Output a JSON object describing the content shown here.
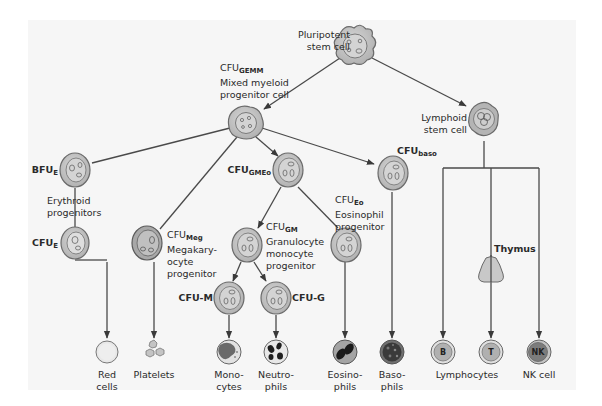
{
  "figure": {
    "colors": {
      "background": "#f6f6f6",
      "cell_fill": "#c4c4c4",
      "cell_outline": "#6a6a6a",
      "nucleus_fill": "#dcdcdc",
      "line": "#4a4a4a",
      "dark_granule": "#222222",
      "thymus_fill": "#c8c8c8"
    }
  },
  "nodes": {
    "pluripotent": {
      "line1": "Pluripotent",
      "line2": "stem cell"
    },
    "gemm": {
      "main": "CFU",
      "sub": "GEMM",
      "line1": "Mixed myeloid",
      "line2": "progenitor cell"
    },
    "bfue": {
      "main": "BFU",
      "sub": "E"
    },
    "erythroid_note": {
      "line1": "Erythroid",
      "line2": "progenitors"
    },
    "cfue": {
      "main": "CFU",
      "sub": "E"
    },
    "meg": {
      "main": "CFU",
      "sub": "Meg",
      "line1": "Megakary-",
      "line2": "ocyte",
      "line3": "progenitor"
    },
    "gmeo": {
      "main": "CFU",
      "sub": "GMEo"
    },
    "gm": {
      "main": "CFU",
      "sub": "GM",
      "line1": "Granulocyte",
      "line2": "monocyte",
      "line3": "progenitor"
    },
    "eo": {
      "main": "CFU",
      "sub": "Eo",
      "line1": "Eosinophil",
      "line2": "progenitor"
    },
    "baso": {
      "main": "CFU",
      "sub": "baso"
    },
    "cfum": {
      "label": "CFU-M"
    },
    "cfug": {
      "label": "CFU-G"
    },
    "lymphoid": {
      "line1": "Lymphoid",
      "line2": "stem cell"
    },
    "thymus": {
      "label": "Thymus"
    }
  },
  "mature_cells": [
    {
      "id": "red",
      "line1": "Red",
      "line2": "cells"
    },
    {
      "id": "platelets",
      "line1": "Platelets",
      "line2": ""
    },
    {
      "id": "mono",
      "line1": "Mono-",
      "line2": "cytes"
    },
    {
      "id": "neutro",
      "line1": "Neutro-",
      "line2": "phils"
    },
    {
      "id": "eosino",
      "line1": "Eosino-",
      "line2": "phils"
    },
    {
      "id": "baso",
      "line1": "Baso-",
      "line2": "phils"
    }
  ],
  "lymphocytes": {
    "group_label": "Lymphocytes",
    "b_label": "B",
    "t_label": "T",
    "nk_label": "NK",
    "nk_caption": "NK cell"
  }
}
